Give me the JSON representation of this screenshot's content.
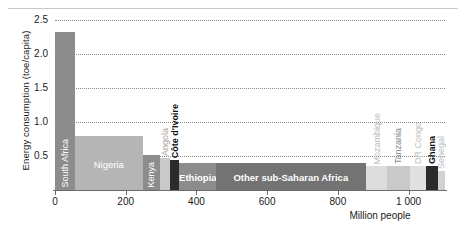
{
  "chart_data": {
    "type": "bar",
    "title": "",
    "xlabel": "Million people",
    "ylabel": "Energy consumption (toe/capita)",
    "xlim": [
      0,
      1103
    ],
    "ylim": [
      0,
      2.5
    ],
    "xticks": [
      "0",
      "200",
      "400",
      "600",
      "800",
      "1 000"
    ],
    "xtick_values": [
      0,
      200,
      400,
      600,
      800,
      1000
    ],
    "yticks": [
      "0.5",
      "1.0",
      "1.5",
      "2.0",
      "2.5"
    ],
    "ytick_values": [
      0.5,
      1.0,
      1.5,
      2.0,
      2.5
    ],
    "grid": "horizontal-dotted",
    "legend": "none",
    "note": "Variable-width (Marimekko) bar chart: width = population in millions, height = energy consumption per capita in toe",
    "bars": [
      {
        "label": "South Africa",
        "width": 56,
        "x0": 0,
        "value": 2.33,
        "fill": "#8c8c8c",
        "label_color": "#ffffff",
        "label_orient": "vert",
        "label_pos": "inside",
        "label_bold": false
      },
      {
        "label": "Nigeria",
        "width": 192,
        "x0": 56,
        "value": 0.79,
        "fill": "#b5b5b5",
        "label_color": "#ffffff",
        "label_orient": "horiz",
        "label_pos": "inside",
        "label_bold": false
      },
      {
        "label": "Kenya",
        "width": 48,
        "x0": 248,
        "value": 0.52,
        "fill": "#8c8c8c",
        "label_color": "#ffffff",
        "label_orient": "vert",
        "label_pos": "inside",
        "label_bold": false
      },
      {
        "label": "Angola",
        "width": 30,
        "x0": 296,
        "value": 0.47,
        "fill": "#c9c9c9",
        "label_color": "#a6a6a6",
        "label_orient": "vert",
        "label_pos": "above",
        "label_bold": false
      },
      {
        "label": "Côte d'Ivoire",
        "width": 25,
        "x0": 326,
        "value": 0.44,
        "fill": "#2b2b2b",
        "label_color": "#111111",
        "label_orient": "vert",
        "label_pos": "above",
        "label_bold": true
      },
      {
        "label": "Ethiopia",
        "width": 104,
        "x0": 351,
        "value": 0.39,
        "fill": "#8c8c8c",
        "label_color": "#ffffff",
        "label_orient": "horiz",
        "label_pos": "inside",
        "label_bold": true
      },
      {
        "label": "Other sub-Saharan Africa",
        "width": 424,
        "x0": 455,
        "value": 0.39,
        "fill": "#737373",
        "label_color": "#ffffff",
        "label_orient": "horiz",
        "label_pos": "inside",
        "label_bold": true
      },
      {
        "label": "Mozambique",
        "width": 61,
        "x0": 879,
        "value": 0.35,
        "fill": "#dcdcdc",
        "label_color": "#bdbdbd",
        "label_orient": "vert",
        "label_pos": "above",
        "label_bold": false
      },
      {
        "label": "Tanzania",
        "width": 63,
        "x0": 940,
        "value": 0.35,
        "fill": "#c9c9c9",
        "label_color": "#8a8a8a",
        "label_orient": "vert",
        "label_pos": "above",
        "label_bold": false
      },
      {
        "label": "DR Congo",
        "width": 46,
        "x0": 1003,
        "value": 0.35,
        "fill": "#e0e0e0",
        "label_color": "#bdbdbd",
        "label_orient": "vert",
        "label_pos": "above",
        "label_bold": false
      },
      {
        "label": "Ghana",
        "width": 33,
        "x0": 1049,
        "value": 0.35,
        "fill": "#2b2b2b",
        "label_color": "#111111",
        "label_orient": "vert",
        "label_pos": "above",
        "label_bold": true
      },
      {
        "label": "Senegal",
        "width": 21,
        "x0": 1082,
        "value": 0.28,
        "fill": "#d2d2d2",
        "label_color": "#bdbdbd",
        "label_orient": "vert",
        "label_pos": "above",
        "label_bold": false
      }
    ]
  }
}
